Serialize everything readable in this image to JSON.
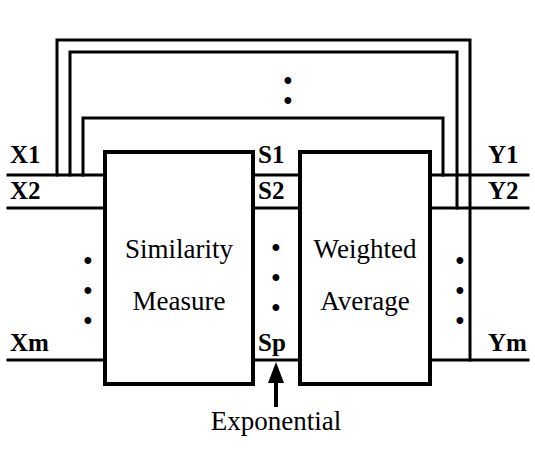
{
  "diagram": {
    "stroke_color": "#000000",
    "background_color": "#ffffff",
    "blocks": [
      {
        "id": "similarity-measure",
        "line1": "Similarity",
        "line2": "Measure"
      },
      {
        "id": "weighted-average",
        "line1": "Weighted",
        "line2": "Average"
      }
    ],
    "inputs": {
      "label_1": "X1",
      "label_2": "X2",
      "label_m": "Xm",
      "ellipsis": "•"
    },
    "intermediate": {
      "label_1": "S1",
      "label_2": "S2",
      "label_p": "Sp",
      "ellipsis": "•"
    },
    "outputs": {
      "label_1": "Y1",
      "label_2": "Y2",
      "label_m": "Ym",
      "ellipsis": "•"
    },
    "annotation": {
      "caption": "Exponential",
      "arrow": "up-arrow"
    },
    "feedback": {
      "count": 3,
      "top_ellipsis": "•"
    }
  }
}
